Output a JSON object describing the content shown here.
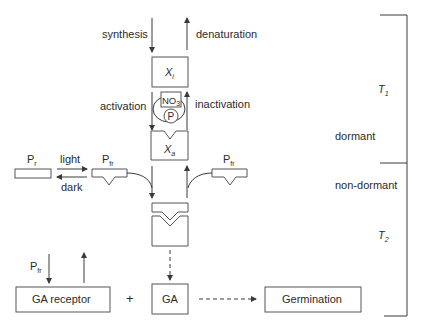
{
  "labels": {
    "synthesis": "synthesis",
    "denaturation": "denaturation",
    "activation": "activation",
    "inactivation": "inactivation",
    "xi_main": "X",
    "xi_sub": "i",
    "xa_main": "X",
    "xa_sub": "a",
    "no3_main": "NO",
    "no3_sub": "3",
    "p_circle": "P",
    "pr_main": "P",
    "pr_sub": "r",
    "pfr_main": "P",
    "pfr_sub": "fr",
    "light": "light",
    "dark": "dark",
    "dormant": "dormant",
    "non_dormant": "non-dormant",
    "t1_main": "T",
    "t1_sub": "1",
    "t2_main": "T",
    "t2_sub": "2",
    "ga_receptor": "GA receptor",
    "plus": "+",
    "ga": "GA",
    "germination": "Germination"
  }
}
